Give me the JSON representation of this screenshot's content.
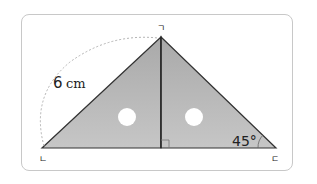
{
  "diagram": {
    "type": "set-square triangle (two right triangles)",
    "side_length": "6",
    "side_unit": "cm",
    "angle": "45°",
    "vertices": {
      "top": "ㄱ",
      "bottom_left": "ㄴ",
      "bottom_right": "ㄷ"
    },
    "colors": {
      "fill": "#b9b9b9",
      "stroke": "#333333",
      "frame": "#c8c8c8"
    }
  }
}
